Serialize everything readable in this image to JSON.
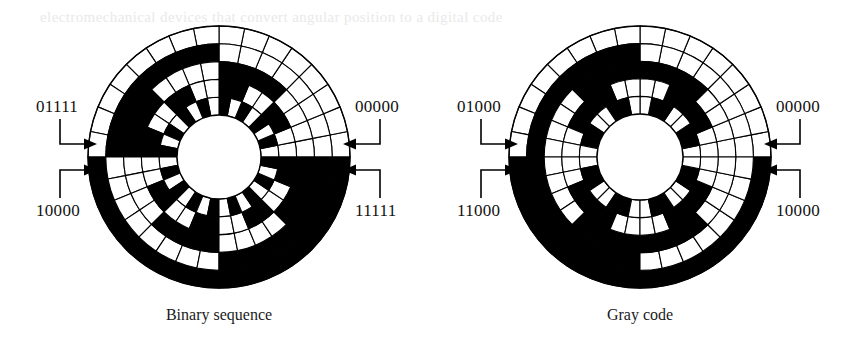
{
  "figure": {
    "background_color": "#ffffff",
    "ink_color": "#000000"
  },
  "discs": [
    {
      "id": "binary",
      "caption": "Binary sequence",
      "center": {
        "x": 219,
        "y": 157
      },
      "outer_radius": 131,
      "hub_radius": 42,
      "ring_count": 5,
      "sector_count": 32,
      "encoding": "natural-binary",
      "labels": {
        "top_right": "00000",
        "bottom_right": "11111",
        "top_left": "01111",
        "bottom_left": "10000"
      },
      "chart_data": {
        "type": "heatmap",
        "title": "Binary sequence",
        "rings_outer_to_inner": [
          "bit5-MSB",
          "bit4",
          "bit3",
          "bit2",
          "bit1-LSB"
        ],
        "sector_count": 32,
        "codes": [
          "00000",
          "00001",
          "00010",
          "00011",
          "00100",
          "00101",
          "00110",
          "00111",
          "01000",
          "01001",
          "01010",
          "01011",
          "01100",
          "01101",
          "01110",
          "01111",
          "10000",
          "10001",
          "10010",
          "10011",
          "10100",
          "10101",
          "10110",
          "10111",
          "11000",
          "11001",
          "11010",
          "11011",
          "11100",
          "11101",
          "11110",
          "11111"
        ]
      }
    },
    {
      "id": "gray",
      "caption": "Gray code",
      "center": {
        "x": 640,
        "y": 157
      },
      "outer_radius": 131,
      "hub_radius": 43,
      "ring_count": 5,
      "sector_count": 32,
      "encoding": "reflected-gray",
      "labels": {
        "top_right": "00000",
        "bottom_right": "10000",
        "top_left": "01000",
        "bottom_left": "11000"
      },
      "chart_data": {
        "type": "heatmap",
        "title": "Gray code",
        "rings_outer_to_inner": [
          "bit5-MSB",
          "bit4",
          "bit3",
          "bit2",
          "bit1-LSB"
        ],
        "sector_count": 32,
        "codes": [
          "00000",
          "00001",
          "00011",
          "00010",
          "00110",
          "00111",
          "00101",
          "00100",
          "01100",
          "01101",
          "01111",
          "01110",
          "01010",
          "01011",
          "01001",
          "01000",
          "11000",
          "11001",
          "11011",
          "11010",
          "11110",
          "11111",
          "11101",
          "11100",
          "10100",
          "10101",
          "10111",
          "10110",
          "10010",
          "10011",
          "10001",
          "10000"
        ]
      }
    }
  ],
  "bleed_through_text": {
    "line": "electromechanical devices that convert angular position to a digital code"
  }
}
